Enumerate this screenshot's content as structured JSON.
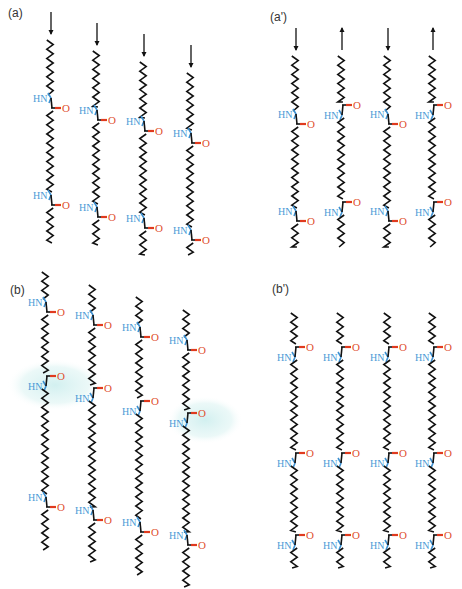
{
  "figure": {
    "colors": {
      "carbon_chain": "#111111",
      "nitrogen": "#4a9ad6",
      "oxygen": "#e0502e",
      "highlight": "#d6f0f0"
    },
    "labels": {
      "nh": "HN",
      "o": "O"
    },
    "panels": [
      {
        "id": "a",
        "label": "(a)",
        "label_pos": [
          8,
          6
        ],
        "arrangement": "parallel",
        "chains": [
          {
            "x": 50,
            "top": 40,
            "arrow": "down",
            "amides": [
              {
                "y": 103,
                "n": "left",
                "o": "right"
              },
              {
                "y": 200,
                "n": "left",
                "o": "right"
              }
            ],
            "bottom": 243
          },
          {
            "x": 96,
            "top": 51,
            "arrow": "down",
            "amides": [
              {
                "y": 115,
                "n": "left",
                "o": "right"
              },
              {
                "y": 212,
                "n": "left",
                "o": "right"
              }
            ],
            "bottom": 245
          },
          {
            "x": 143,
            "top": 62,
            "arrow": "down",
            "amides": [
              {
                "y": 126,
                "n": "left",
                "o": "right"
              },
              {
                "y": 223,
                "n": "left",
                "o": "right"
              }
            ],
            "bottom": 255
          },
          {
            "x": 190,
            "top": 73,
            "arrow": "down",
            "amides": [
              {
                "y": 138,
                "n": "left",
                "o": "right"
              },
              {
                "y": 235,
                "n": "left",
                "o": "right"
              }
            ],
            "bottom": 255
          }
        ]
      },
      {
        "id": "a-prime",
        "label": "(a')",
        "label_pos": [
          270,
          10
        ],
        "arrangement": "antiparallel",
        "chains": [
          {
            "x": 295,
            "top": 56,
            "arrow": "down",
            "amides": [
              {
                "y": 119,
                "n": "left",
                "o": "right"
              },
              {
                "y": 216,
                "n": "left",
                "o": "right"
              }
            ],
            "bottom": 247
          },
          {
            "x": 341,
            "top": 56,
            "arrow": "up",
            "amides": [
              {
                "y": 110,
                "n": "left",
                "o": "right",
                "flip": true
              },
              {
                "y": 207,
                "n": "left",
                "o": "right",
                "flip": true
              }
            ],
            "bottom": 247
          },
          {
            "x": 387,
            "top": 56,
            "arrow": "down",
            "amides": [
              {
                "y": 119,
                "n": "left",
                "o": "right"
              },
              {
                "y": 216,
                "n": "left",
                "o": "right"
              }
            ],
            "bottom": 247
          },
          {
            "x": 432,
            "top": 56,
            "arrow": "up",
            "amides": [
              {
                "y": 110,
                "n": "left",
                "o": "right",
                "flip": true
              },
              {
                "y": 207,
                "n": "left",
                "o": "right",
                "flip": true
              }
            ],
            "bottom": 247
          }
        ]
      },
      {
        "id": "b",
        "label": "(b)",
        "label_pos": [
          10,
          283
        ],
        "arrangement": "sheared parallel",
        "highlight_ellipses": [
          {
            "cx": 55,
            "cy": 385,
            "rx": 48,
            "ry": 26
          },
          {
            "cx": 205,
            "cy": 420,
            "rx": 38,
            "ry": 24
          }
        ],
        "chains": [
          {
            "x": 45,
            "top": 272,
            "amides": [
              {
                "y": 307,
                "n": "left",
                "o": "right"
              },
              {
                "y": 381,
                "n": "left",
                "o": "right",
                "flip": true
              },
              {
                "y": 502,
                "n": "left",
                "o": "right"
              }
            ],
            "bottom": 550
          },
          {
            "x": 92,
            "top": 285,
            "amides": [
              {
                "y": 320,
                "n": "left",
                "o": "right"
              },
              {
                "y": 393,
                "n": "left",
                "o": "right",
                "flip": true
              },
              {
                "y": 515,
                "n": "left",
                "o": "right"
              }
            ],
            "bottom": 562
          },
          {
            "x": 139,
            "top": 297,
            "amides": [
              {
                "y": 332,
                "n": "left",
                "o": "right"
              },
              {
                "y": 406,
                "n": "left",
                "o": "right",
                "flip": true
              },
              {
                "y": 527,
                "n": "left",
                "o": "right"
              }
            ],
            "bottom": 575
          },
          {
            "x": 186,
            "top": 310,
            "amides": [
              {
                "y": 345,
                "n": "left",
                "o": "right"
              },
              {
                "y": 418,
                "n": "left",
                "o": "right",
                "flip": true
              },
              {
                "y": 540,
                "n": "left",
                "o": "right"
              }
            ],
            "bottom": 587
          }
        ]
      },
      {
        "id": "b-prime",
        "label": "(b')",
        "label_pos": [
          272,
          282
        ],
        "arrangement": "aligned",
        "chains": [
          {
            "x": 294,
            "top": 313,
            "amides": [
              {
                "y": 352,
                "n": "left",
                "o": "right",
                "flip": true
              },
              {
                "y": 458,
                "n": "left",
                "o": "right",
                "flip": true
              },
              {
                "y": 540,
                "n": "left",
                "o": "right",
                "flip": true
              }
            ],
            "bottom": 568
          },
          {
            "x": 340,
            "top": 313,
            "amides": [
              {
                "y": 352,
                "n": "left",
                "o": "right",
                "flip": true
              },
              {
                "y": 458,
                "n": "left",
                "o": "right",
                "flip": true
              },
              {
                "y": 540,
                "n": "left",
                "o": "right",
                "flip": true
              }
            ],
            "bottom": 568
          },
          {
            "x": 387,
            "top": 313,
            "amides": [
              {
                "y": 352,
                "n": "left",
                "o": "right",
                "flip": true
              },
              {
                "y": 458,
                "n": "left",
                "o": "right",
                "flip": true
              },
              {
                "y": 540,
                "n": "left",
                "o": "right",
                "flip": true
              }
            ],
            "bottom": 568
          },
          {
            "x": 432,
            "top": 313,
            "amides": [
              {
                "y": 352,
                "n": "left",
                "o": "right",
                "flip": true
              },
              {
                "y": 458,
                "n": "left",
                "o": "right",
                "flip": true
              },
              {
                "y": 540,
                "n": "left",
                "o": "right",
                "flip": true
              }
            ],
            "bottom": 568
          }
        ]
      }
    ]
  }
}
